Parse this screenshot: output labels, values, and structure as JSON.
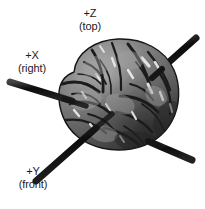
{
  "figure": {
    "background_color": "#ffffff",
    "width": 205,
    "height": 209
  },
  "axes": {
    "z": {
      "label": "+Z",
      "description": "(top)",
      "color": "#111111",
      "direction": "vertical",
      "from": [
        108,
        209
      ],
      "to": [
        108,
        12
      ]
    },
    "x": {
      "label": "+X",
      "description": "(right)",
      "color": "#111111",
      "direction": "diagonal-down-right",
      "from": [
        10,
        82
      ],
      "to": [
        192,
        160
      ]
    },
    "y": {
      "label": "+Y",
      "description": "(front)",
      "color": "#111111",
      "direction": "diagonal-up-right",
      "from": [
        36,
        181
      ],
      "to": [
        196,
        38
      ]
    }
  },
  "brain": {
    "name": "brain-render",
    "center": [
      118,
      95
    ],
    "radius_x": 60,
    "radius_y": 55,
    "base_color": "#8a8a8a",
    "shadow_color": "#2f2f2f",
    "highlight_color": "#ececec",
    "outline_color": "#1a1a1a"
  }
}
